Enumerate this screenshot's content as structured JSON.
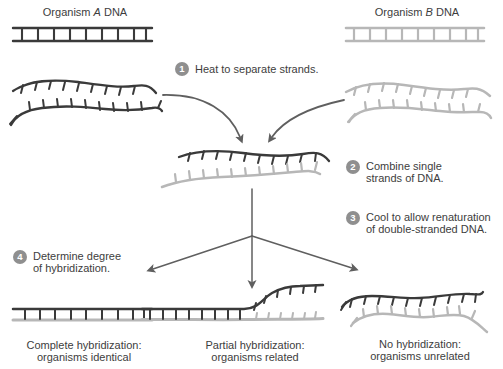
{
  "colors": {
    "background": "#ffffff",
    "dark_strand": "#3a3a3a",
    "light_strand": "#b7b7b7",
    "arrow": "#5f5f5f",
    "badge_bg": "#8f8f8f",
    "badge_text": "#ffffff",
    "text": "#3d3d3d"
  },
  "labels": {
    "organism_a": {
      "prefix": "Organism ",
      "letter": "A",
      "suffix": " DNA"
    },
    "organism_b": {
      "prefix": "Organism ",
      "letter": "B",
      "suffix": " DNA"
    }
  },
  "steps": [
    {
      "num": "1",
      "line1": "Heat to separate strands."
    },
    {
      "num": "2",
      "line1": "Combine single",
      "line2": "strands of DNA."
    },
    {
      "num": "3",
      "line1": "Cool to allow renaturation",
      "line2": "of double-stranded DNA."
    },
    {
      "num": "4",
      "line1": "Determine degree",
      "line2": "of hybridization."
    }
  ],
  "results": [
    {
      "line1": "Complete hybridization:",
      "line2": "organisms identical"
    },
    {
      "line1": "Partial hybridization:",
      "line2": "organisms related"
    },
    {
      "line1": "No hybridization:",
      "line2": "organisms unrelated"
    }
  ]
}
